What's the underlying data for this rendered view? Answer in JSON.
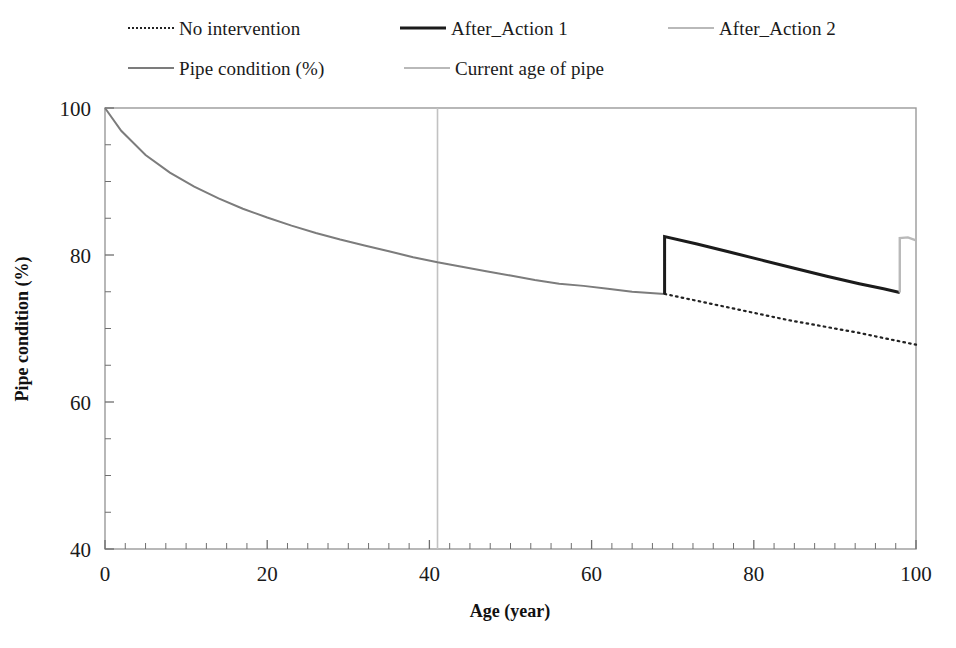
{
  "figure": {
    "background": "#ffffff",
    "plot_border_color": "#9a9a9a"
  },
  "legend": {
    "position": "top",
    "rows": [
      [
        {
          "label": "No intervention",
          "style": "dotted",
          "color": "#222222",
          "x": 128
        },
        {
          "label": "After_Action 1",
          "style": "solid-dark",
          "color": "#1b1b1b",
          "x": 400
        },
        {
          "label": "After_Action 2",
          "style": "solid-light",
          "color": "#b9b9b9",
          "x": 668
        }
      ],
      [
        {
          "label": "Pipe condition (%)",
          "style": "solid-mid",
          "color": "#7c7c7c",
          "x": 128
        },
        {
          "label": "Current age of pipe",
          "style": "solid-light",
          "color": "#c2c2c2",
          "x": 404
        }
      ]
    ]
  },
  "chart_data": {
    "type": "line",
    "title": "",
    "xlabel": "Age (year)",
    "ylabel": "Pipe condition (%)",
    "xlim": [
      0,
      100
    ],
    "ylim": [
      40,
      100
    ],
    "xticks": [
      0,
      20,
      40,
      60,
      80,
      100
    ],
    "yticks": [
      40,
      60,
      80,
      100
    ],
    "x_minor_tick_step": 2.5,
    "y_minor_tick_step": 5,
    "grid": false,
    "legend_position": "top",
    "annotations": [
      {
        "name": "current-age-marker",
        "type": "vline",
        "x": 41,
        "label": "Current age of pipe",
        "color": "#c2c2c2"
      },
      {
        "name": "action-1-intervention",
        "type": "jump",
        "x": 69,
        "from": 74.7,
        "to": 82.5
      },
      {
        "name": "action-2-intervention",
        "type": "jump",
        "x": 98,
        "from": 74.8,
        "to": 82.3
      }
    ],
    "series": [
      {
        "name": "Pipe condition (%)",
        "style": "solid",
        "color": "#7c7c7c",
        "width": 2,
        "comment": "baseline deterioration curve from age 0 to 69",
        "x": [
          0,
          2,
          5,
          8,
          11,
          14,
          17,
          20,
          23,
          26,
          29,
          32,
          35,
          38,
          41,
          44,
          47,
          50,
          53,
          56,
          59,
          62,
          65,
          69
        ],
        "y": [
          100.0,
          96.9,
          93.6,
          91.2,
          89.3,
          87.7,
          86.3,
          85.1,
          84.0,
          83.0,
          82.1,
          81.3,
          80.5,
          79.7,
          79.0,
          78.4,
          77.8,
          77.2,
          76.6,
          76.1,
          75.8,
          75.4,
          75.0,
          74.7
        ]
      },
      {
        "name": "No intervention",
        "style": "dotted",
        "color": "#222222",
        "width": 2.2,
        "comment": "continued deterioration without action, age 69 to 100",
        "x": [
          69,
          72,
          75,
          78,
          81,
          84,
          87,
          90,
          93,
          96,
          100
        ],
        "y": [
          74.7,
          74.0,
          73.3,
          72.6,
          71.9,
          71.2,
          70.6,
          70.0,
          69.4,
          68.7,
          67.8
        ]
      },
      {
        "name": "After_Action 1",
        "style": "solid",
        "color": "#1b1b1b",
        "width": 3,
        "comment": "condition jumps to 82.5 at age 69 then deteriorates to 74.9 at age 98",
        "x": [
          69,
          69,
          73,
          77,
          81,
          85,
          89,
          93,
          96,
          98
        ],
        "y": [
          74.7,
          82.5,
          81.5,
          80.4,
          79.3,
          78.2,
          77.1,
          76.1,
          75.4,
          74.9
        ]
      },
      {
        "name": "After_Action 2",
        "style": "solid",
        "color": "#b9b9b9",
        "width": 2.4,
        "comment": "second intervention jump at age 98 up to 82.3 then slight decline to 100",
        "x": [
          98,
          98,
          99,
          100
        ],
        "y": [
          74.9,
          82.3,
          82.4,
          82.0
        ]
      }
    ]
  }
}
